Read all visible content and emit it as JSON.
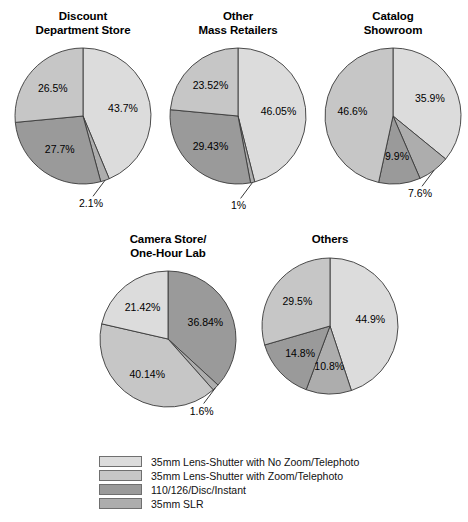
{
  "figure": {
    "type": "pie-chart-grid",
    "background": "#ffffff"
  },
  "legend": {
    "position": "bottom-center",
    "items": [
      {
        "label": "35mm Lens-Shutter with No Zoom/Telephoto",
        "color": "#dcdcdc"
      },
      {
        "label": "35mm Lens-Shutter with Zoom/Telephoto",
        "color": "#c6c6c6"
      },
      {
        "label": "110/126/Disc/Instant",
        "color": "#9a9a9a"
      },
      {
        "label": "35mm SLR",
        "color": "#adadad"
      }
    ]
  },
  "chart_data": [
    {
      "type": "pie",
      "title": "Discount\nDepartment Store",
      "categories": [
        "35mm Lens-Shutter with No Zoom/Telephoto",
        "35mm SLR",
        "110/126/Disc/Instant",
        "35mm Lens-Shutter with Zoom/Telephoto"
      ],
      "values": [
        43.7,
        2.1,
        27.7,
        26.5
      ],
      "labels": [
        "43.7%",
        "2.1%",
        "27.7%",
        "26.5%"
      ],
      "colors": [
        "#dcdcdc",
        "#adadad",
        "#9a9a9a",
        "#c6c6c6"
      ],
      "label_placement": [
        "inside",
        "outside",
        "inside",
        "inside"
      ],
      "start_angle_deg": 0,
      "direction": "clockwise"
    },
    {
      "type": "pie",
      "title": "Other\nMass Retailers",
      "categories": [
        "35mm Lens-Shutter with No Zoom/Telephoto",
        "35mm SLR",
        "110/126/Disc/Instant",
        "35mm Lens-Shutter with Zoom/Telephoto"
      ],
      "values": [
        46.05,
        1,
        29.43,
        23.52
      ],
      "labels": [
        "46.05%",
        "1%",
        "29.43%",
        "23.52%"
      ],
      "colors": [
        "#dcdcdc",
        "#adadad",
        "#9a9a9a",
        "#c6c6c6"
      ],
      "label_placement": [
        "inside",
        "outside",
        "inside",
        "inside"
      ],
      "start_angle_deg": 0,
      "direction": "clockwise"
    },
    {
      "type": "pie",
      "title": "Catalog\nShowroom",
      "categories": [
        "35mm Lens-Shutter with No Zoom/Telephoto",
        "35mm SLR",
        "110/126/Disc/Instant",
        "35mm Lens-Shutter with Zoom/Telephoto"
      ],
      "values": [
        35.9,
        7.6,
        9.9,
        46.6
      ],
      "labels": [
        "35.9%",
        "7.6%",
        "9.9%",
        "46.6%"
      ],
      "colors": [
        "#dcdcdc",
        "#adadad",
        "#9a9a9a",
        "#c6c6c6"
      ],
      "label_placement": [
        "inside",
        "outside",
        "inside",
        "inside"
      ],
      "start_angle_deg": 0,
      "direction": "clockwise"
    },
    {
      "type": "pie",
      "title": "Camera Store/\nOne-Hour Lab",
      "categories": [
        "110/126/Disc/Instant",
        "35mm SLR",
        "35mm Lens-Shutter with Zoom/Telephoto",
        "35mm Lens-Shutter with No Zoom/Telephoto"
      ],
      "values": [
        36.84,
        1.6,
        40.14,
        21.42
      ],
      "labels": [
        "36.84%",
        "1.6%",
        "40.14%",
        "21.42%"
      ],
      "colors": [
        "#9a9a9a",
        "#adadad",
        "#c6c6c6",
        "#dcdcdc"
      ],
      "label_placement": [
        "inside",
        "outside",
        "inside",
        "inside"
      ],
      "start_angle_deg": 0,
      "direction": "clockwise"
    },
    {
      "type": "pie",
      "title": "Others",
      "categories": [
        "35mm Lens-Shutter with No Zoom/Telephoto",
        "35mm SLR",
        "110/126/Disc/Instant",
        "35mm Lens-Shutter with Zoom/Telephoto"
      ],
      "values": [
        44.9,
        10.8,
        14.8,
        29.5
      ],
      "labels": [
        "44.9%",
        "10.8%",
        "14.8%",
        "29.5%"
      ],
      "colors": [
        "#dcdcdc",
        "#adadad",
        "#9a9a9a",
        "#c6c6c6"
      ],
      "label_placement": [
        "inside",
        "inside",
        "inside",
        "inside"
      ],
      "start_angle_deg": 0,
      "direction": "clockwise"
    }
  ]
}
